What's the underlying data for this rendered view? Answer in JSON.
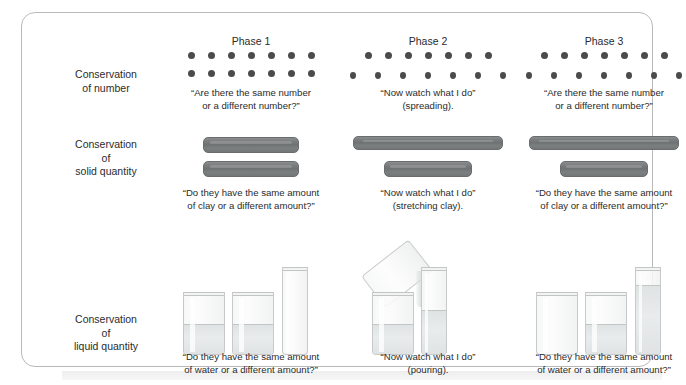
{
  "diagram": {
    "row_labels": [
      {
        "id": "number",
        "text": "Conservation\nof number"
      },
      {
        "id": "solid",
        "text": "Conservation\nof\nsolid quantity"
      },
      {
        "id": "liquid",
        "text": "Conservation\nof\nliquid quantity"
      }
    ],
    "columns": [
      {
        "id": "phase-1",
        "title": "Phase 1",
        "number_caption": "“Are there the same number\nor a different number?”",
        "clay_caption": "“Do they have the same amount\nof clay or a different amount?”",
        "liquid_caption": "“Do they have the same amount\nof water or a different amount?”",
        "dots_top": 7,
        "dots_bottom": 7,
        "dots_top_spacing": "even",
        "dots_bottom_spacing": "even"
      },
      {
        "id": "phase-2",
        "title": "Phase 2",
        "number_caption": "“Now watch what I do”\n(spreading).",
        "clay_caption": "“Now watch what I do”\n(stretching clay).",
        "liquid_caption": "“Now watch what I do”\n(pouring).",
        "dots_top": 7,
        "dots_bottom": 7,
        "dots_top_spacing": "tight",
        "dots_bottom_spacing": "wide"
      },
      {
        "id": "phase-3",
        "title": "Phase 3",
        "number_caption": "“Are there the same number\nor a different number?”",
        "clay_caption": "“Do they have the same amount\nof clay or a different amount?”",
        "liquid_caption": "“Do they have the same amount\nof water or a different amount?”",
        "dots_top": 7,
        "dots_bottom": 7,
        "dots_top_spacing": "tight",
        "dots_bottom_spacing": "wide"
      }
    ],
    "colors": {
      "dot": "#4b4b4b",
      "clay": "#767a7b",
      "glass_outline": "#c8c9ca",
      "water": "#e3e7e7",
      "card_border": "#b9b9b9",
      "text": "#2b2b2b"
    }
  }
}
